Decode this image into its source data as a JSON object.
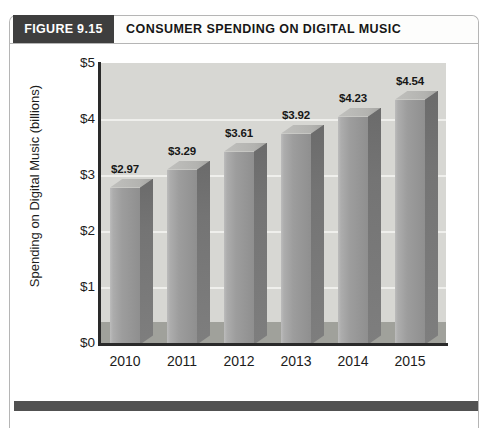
{
  "figure": {
    "label": "FIGURE 9.15",
    "title": "CONSUMER SPENDING ON DIGITAL MUSIC"
  },
  "chart_data": {
    "type": "bar",
    "style": "3d-column",
    "title": "Consumer Spending on Digital Music",
    "categories": [
      "2010",
      "2011",
      "2012",
      "2013",
      "2014",
      "2015"
    ],
    "values": [
      2.97,
      3.29,
      3.61,
      3.92,
      4.23,
      4.54
    ],
    "data_labels": [
      "$2.97",
      "$3.29",
      "$3.61",
      "$3.92",
      "$4.23",
      "$4.54"
    ],
    "xlabel": "",
    "ylabel": "Spending on Digital Music  (billions)",
    "y_ticks": [
      "$0",
      "$1",
      "$2",
      "$3",
      "$4",
      "$5"
    ],
    "ylim": [
      0,
      5
    ],
    "grid": true,
    "legend_position": "none",
    "colors": {
      "bar_front": "#9d9d9d",
      "bar_side": "#747474",
      "bar_top": "#b3b3b0",
      "plot_bg": "#d7d7d3",
      "floor_band": "#a0a19b",
      "gridline": "#efefec",
      "axis": "#2a2a2a",
      "badge_bg": "#3e3e3e",
      "badge_text": "#ffffff",
      "footer_rule": "#515151",
      "border": "#b5b5b5"
    }
  }
}
